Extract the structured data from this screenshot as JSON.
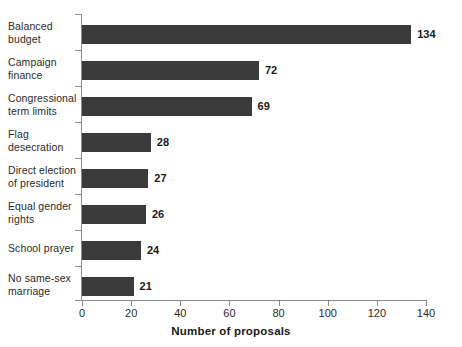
{
  "chart_data": {
    "type": "bar",
    "orientation": "horizontal",
    "title": "",
    "xlabel": "Number of proposals",
    "ylabel": "",
    "xlim": [
      0,
      140
    ],
    "xticks": [
      0,
      20,
      40,
      60,
      80,
      100,
      120,
      140
    ],
    "grid": false,
    "legend": null,
    "bar_color": "#3b3b3b",
    "axis_color": "#8c8c8c",
    "categories": [
      "Balanced budget",
      "Campaign finance",
      "Congressional term limits",
      "Flag desecration",
      "Direct election of president",
      "Equal gender rights",
      "School prayer",
      "No same-sex marriage"
    ],
    "category_lines": [
      [
        "Balanced",
        "budget"
      ],
      [
        "Campaign",
        "finance"
      ],
      [
        "Congressional",
        "term limits"
      ],
      [
        "Flag",
        "desecration"
      ],
      [
        "Direct election",
        "of president"
      ],
      [
        "Equal gender",
        "rights"
      ],
      [
        "School prayer"
      ],
      [
        "No same-sex",
        "marriage"
      ]
    ],
    "values": [
      134,
      72,
      69,
      28,
      27,
      26,
      24,
      21
    ],
    "value_labels": [
      "134",
      "72",
      "69",
      "28",
      "27",
      "26",
      "24",
      "21"
    ]
  }
}
